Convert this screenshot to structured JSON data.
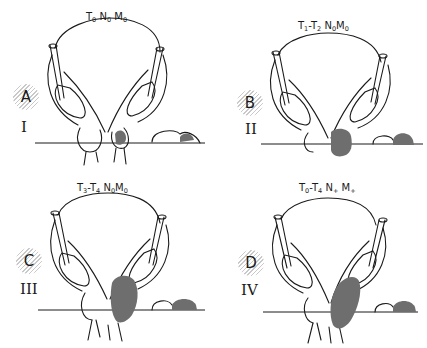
{
  "figure": {
    "type": "anatomical staging diagram",
    "colors": {
      "line": "#1a1a1a",
      "tumor_fill": "#6e6e6e",
      "hatch": "#c9c9c9",
      "background": "#ffffff"
    },
    "panels": [
      {
        "id": "A",
        "letter": "A",
        "roman": "I",
        "stage": {
          "T": "T",
          "T_sub": "0",
          "range": "",
          "N_sub": "0",
          "M_sub": "0",
          "text": "T0 N0 M0"
        }
      },
      {
        "id": "B",
        "letter": "B",
        "roman": "II",
        "stage": {
          "text": "T1-T2 N0 M0"
        }
      },
      {
        "id": "C",
        "letter": "C",
        "roman": "III",
        "stage": {
          "text": "T3-T4 N0 M0"
        }
      },
      {
        "id": "D",
        "letter": "D",
        "roman": "IV",
        "stage": {
          "text": "T0-T4 N+ M+"
        }
      }
    ],
    "labels": {
      "A": {
        "t1": "T",
        "t1s": "0",
        "dash": "",
        "t2": "",
        "t2s": "",
        "n": "N",
        "ns": "0",
        "m": "M",
        "ms": "0"
      },
      "B": {
        "t1": "T",
        "t1s": "1",
        "dash": "-",
        "t2": "T",
        "t2s": "2",
        "n": "N",
        "ns": "0",
        "m": "M",
        "ms": "0"
      },
      "C": {
        "t1": "T",
        "t1s": "3",
        "dash": "-",
        "t2": "T",
        "t2s": "4",
        "n": "N",
        "ns": "0",
        "m": "M",
        "ms": "0"
      },
      "D": {
        "t1": "T",
        "t1s": "0",
        "dash": "-",
        "t2": "T",
        "t2s": "4",
        "n": "N",
        "ns": "+",
        "m": "M",
        "ms": "+"
      }
    },
    "caption": "(caption text truncated at bottom edge — not legible)"
  }
}
